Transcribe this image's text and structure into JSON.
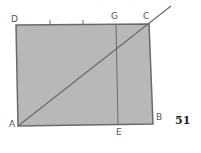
{
  "diagram": {
    "figure_number": "51",
    "colors": {
      "fill": "#b8b8b8",
      "stroke": "#6a6a6a",
      "background": "#ffffff"
    },
    "points": {
      "A": {
        "label": "A",
        "x": 18,
        "y": 126
      },
      "B": {
        "label": "B",
        "x": 153,
        "y": 124
      },
      "C": {
        "label": "C",
        "x": 149,
        "y": 24
      },
      "D": {
        "label": "D",
        "x": 16,
        "y": 25
      },
      "G": {
        "label": "G",
        "x": 116,
        "y": 24
      },
      "E": {
        "label": "E",
        "x": 118,
        "y": 125
      }
    },
    "rectangle": [
      "A",
      "B",
      "C",
      "D"
    ],
    "segments": [
      {
        "from": "A",
        "to": "C",
        "extended": true
      },
      {
        "from": "G",
        "to": "E"
      }
    ],
    "tick_marks": [
      {
        "x": 50,
        "y": 24
      },
      {
        "x": 83,
        "y": 24
      }
    ]
  }
}
